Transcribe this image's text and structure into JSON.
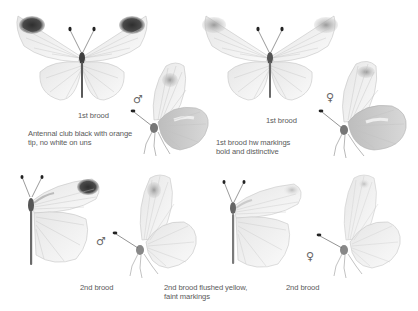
{
  "plate": {
    "figures": [
      {
        "id": "male-1st-brood-upperside",
        "view": "upperside, wings open",
        "sex": "male",
        "brood": "1st brood"
      },
      {
        "id": "male-1st-brood-underside",
        "view": "underside, side view",
        "sex": "male",
        "brood": "1st brood"
      },
      {
        "id": "female-1st-brood-upperside",
        "view": "upperside, wings open",
        "sex": "female",
        "brood": "1st brood"
      },
      {
        "id": "female-1st-brood-underside",
        "view": "underside, side view",
        "sex": "female",
        "brood": "1st brood"
      },
      {
        "id": "male-2nd-brood-upperside",
        "view": "upperside, half open",
        "sex": "male",
        "brood": "2nd brood"
      },
      {
        "id": "male-2nd-brood-underside",
        "view": "underside, side view",
        "sex": "male",
        "brood": "2nd brood"
      },
      {
        "id": "female-2nd-brood-upperside",
        "view": "upperside, half open",
        "sex": "female",
        "brood": "2nd brood"
      },
      {
        "id": "female-2nd-brood-underside",
        "view": "underside, side view",
        "sex": "female",
        "brood": "2nd brood"
      }
    ],
    "symbols": {
      "male": "♂",
      "female": "♀"
    },
    "labels": {
      "top_left_brood": "1st brood",
      "top_left_note_line1": "Antennal club black with orange",
      "top_left_note_line2": "tip, no white on uns",
      "top_right_brood": "1st brood",
      "top_right_note_line1": "1st brood hw markings",
      "top_right_note_line2": "bold and distinctive",
      "bottom_left_brood": "2nd brood",
      "bottom_middle_note_line1": "2nd brood flushed yellow,",
      "bottom_middle_note_line2": "faint markings",
      "bottom_right_brood": "2nd brood"
    },
    "colors": {
      "background": "#ffffff",
      "wing_fill": "#f4f4f4",
      "wing_vein": "#b8b8b8",
      "apex_dark": "#3a3a3a",
      "body": "#555555",
      "text": "#5a5a5a"
    }
  }
}
